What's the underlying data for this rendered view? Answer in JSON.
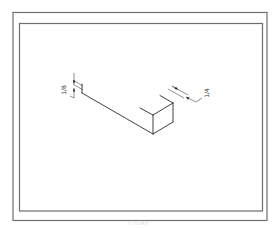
{
  "drawing": {
    "type": "isometric technical drawing",
    "subject": "rectangular bar / stock in isometric view",
    "dimensions": [
      {
        "id": "thickness",
        "numerator": "1",
        "denominator": "8",
        "label": "1/8"
      },
      {
        "id": "width",
        "numerator": "1",
        "denominator": "4",
        "label": "1/4"
      }
    ]
  },
  "caption": "FIGURE"
}
